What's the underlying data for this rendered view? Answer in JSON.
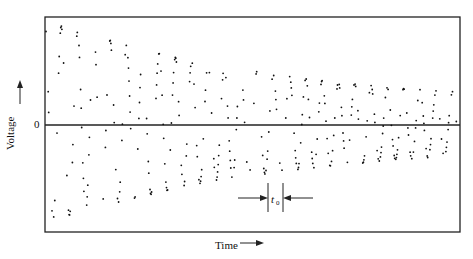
{
  "chart_data": {
    "type": "scatter",
    "title": "",
    "xlabel": "Time",
    "ylabel": "Voltage",
    "y_tick_labels": [
      "0"
    ],
    "annotation": {
      "label": "t0",
      "description": "period marker between two vertical bars with inward arrows"
    },
    "cycles": 26,
    "period_px": 16.3,
    "frame": {
      "left": 45,
      "right": 460,
      "top": 17,
      "bottom": 232,
      "zero_y": 125
    },
    "peak_amplitudes": [
      1.0,
      0.98,
      0.92,
      0.89,
      0.84,
      0.79,
      0.75,
      0.71,
      0.67,
      0.63,
      0.6,
      0.57,
      0.55,
      0.53,
      0.5,
      0.48,
      0.46,
      0.44,
      0.42,
      0.41,
      0.39,
      0.37,
      0.36,
      0.35,
      0.34,
      0.33
    ],
    "grid": false,
    "legend": null
  },
  "labels": {
    "ylabel": "Voltage",
    "ytick_zero": "0",
    "xlabel": "Time",
    "t0_base": "t",
    "t0_sub": "0"
  }
}
